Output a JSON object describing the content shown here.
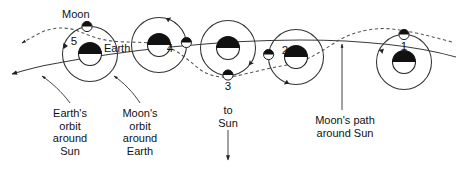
{
  "figure": {
    "type": "astronomy-diagram",
    "title_visible": false,
    "background_color": "#ffffff",
    "line_color": "#222222",
    "text_color": "#111111"
  },
  "labels": {
    "moon": "Moon",
    "earth": "Earth",
    "earths_orbit_around_sun": "Earth's\norbit\naround\nSun",
    "moons_orbit_around_earth": "Moon's\norbit\naround\nEarth",
    "to_sun": "to\nSun",
    "moons_path_around_sun": "Moon's path\naround Sun"
  },
  "positions": [
    {
      "number": "1",
      "moon_phase_position": "top",
      "label_x": 404,
      "label_y": 46
    },
    {
      "number": "2",
      "moon_phase_position": "left",
      "label_x": 285,
      "label_y": 50
    },
    {
      "number": "3",
      "moon_phase_position": "bottom",
      "label_x": 228,
      "label_y": 78
    },
    {
      "number": "4",
      "moon_phase_position": "right",
      "label_x": 170,
      "label_y": 48
    },
    {
      "number": "5",
      "moon_phase_position": "top",
      "label_x": 74,
      "label_y": 41
    }
  ],
  "legend": {
    "earth_orbit_line_style": "solid",
    "moon_path_line_style": "dashed",
    "moon_orbit_line_style": "solid-circle",
    "earth_shading": "dark half facing away from Sun",
    "moon_shading": "dark half facing away from Sun"
  },
  "annotations": {
    "to_sun_direction": "down",
    "motion_direction": "right to left (arrowheads point left)"
  }
}
